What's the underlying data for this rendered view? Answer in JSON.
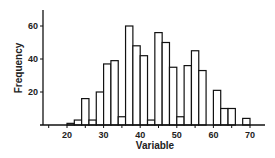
{
  "chart_data": {
    "type": "bar",
    "title": "",
    "xlabel": "Variable",
    "ylabel": "Frequency",
    "xlim": [
      14,
      74
    ],
    "ylim": [
      0,
      70
    ],
    "bin_width": 2,
    "xticks": [
      20,
      30,
      40,
      50,
      60,
      70
    ],
    "yticks": [
      20,
      40,
      60
    ],
    "grid": false,
    "legend": null,
    "bins": [
      {
        "start": 20,
        "end": 22,
        "count": 1
      },
      {
        "start": 22,
        "end": 24,
        "count": 3
      },
      {
        "start": 24,
        "end": 26,
        "count": 16
      },
      {
        "start": 26,
        "end": 28,
        "count": 3
      },
      {
        "start": 28,
        "end": 30,
        "count": 20
      },
      {
        "start": 30,
        "end": 32,
        "count": 37
      },
      {
        "start": 32,
        "end": 34,
        "count": 39
      },
      {
        "start": 34,
        "end": 36,
        "count": 5
      },
      {
        "start": 36,
        "end": 38,
        "count": 60
      },
      {
        "start": 38,
        "end": 40,
        "count": 48
      },
      {
        "start": 40,
        "end": 42,
        "count": 42
      },
      {
        "start": 42,
        "end": 44,
        "count": 3
      },
      {
        "start": 44,
        "end": 46,
        "count": 56
      },
      {
        "start": 46,
        "end": 48,
        "count": 50
      },
      {
        "start": 48,
        "end": 50,
        "count": 35
      },
      {
        "start": 50,
        "end": 52,
        "count": 5
      },
      {
        "start": 52,
        "end": 54,
        "count": 36
      },
      {
        "start": 54,
        "end": 56,
        "count": 45
      },
      {
        "start": 56,
        "end": 58,
        "count": 33
      },
      {
        "start": 58,
        "end": 60,
        "count": 0
      },
      {
        "start": 60,
        "end": 62,
        "count": 21
      },
      {
        "start": 62,
        "end": 64,
        "count": 10
      },
      {
        "start": 64,
        "end": 66,
        "count": 10
      },
      {
        "start": 66,
        "end": 68,
        "count": 0
      },
      {
        "start": 68,
        "end": 70,
        "count": 4
      }
    ]
  },
  "style": {
    "bar_fill": "#ffffff",
    "bar_stroke": "#111111",
    "axis_color": "#111111"
  }
}
